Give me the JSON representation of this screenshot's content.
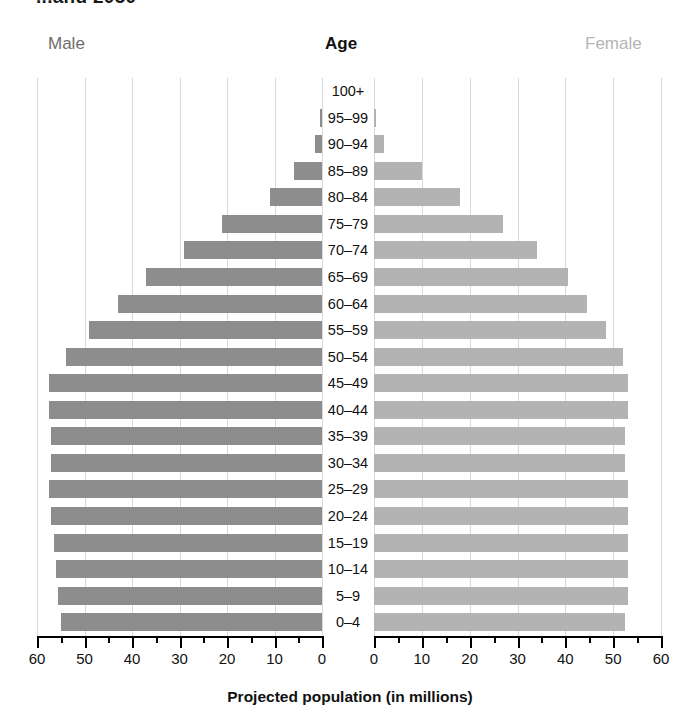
{
  "title_partial": "...and 2050",
  "headers": {
    "male": "Male",
    "age": "Age",
    "female": "Female"
  },
  "axis": {
    "xlabel": "Projected population (in millions)",
    "left_ticks": [
      "60",
      "50",
      "40",
      "30",
      "20",
      "10",
      "0"
    ],
    "right_ticks": [
      "0",
      "10",
      "20",
      "30",
      "40",
      "50",
      "60"
    ],
    "max": 60,
    "minor_step": 5
  },
  "colors": {
    "male_bar": "#8d8d8d",
    "female_bar": "#b3b3b3",
    "male_label": "#6d6d6d",
    "female_label": "#b5b5b5",
    "age_label": "#111111",
    "gridline": "#d8d8d8",
    "axis": "#000000",
    "background": "#ffffff"
  },
  "chart_data": {
    "type": "bar",
    "subtype": "population-pyramid",
    "xlabel": "Projected population (in millions)",
    "ylabel": "Age",
    "xlim": [
      0,
      60
    ],
    "grid": true,
    "legend": [
      "Male",
      "Female"
    ],
    "legend_position": "top",
    "orientation": "horizontal",
    "categories": [
      "100+",
      "95–99",
      "90–94",
      "85–89",
      "80–84",
      "75–79",
      "70–74",
      "65–69",
      "60–64",
      "55–59",
      "50–54",
      "45–49",
      "40–44",
      "35–39",
      "30–34",
      "25–29",
      "20–24",
      "15–19",
      "10–14",
      "5–9",
      "0–4"
    ],
    "series": [
      {
        "name": "Male",
        "side": "left",
        "color": "#8d8d8d",
        "values": [
          0.0,
          0.4,
          1.4,
          6.0,
          11.0,
          21.0,
          29.0,
          37.0,
          43.0,
          49.0,
          54.0,
          57.5,
          57.5,
          57.0,
          57.0,
          57.5,
          57.0,
          56.5,
          56.0,
          55.5,
          55.0
        ]
      },
      {
        "name": "Female",
        "side": "right",
        "color": "#b3b3b3",
        "values": [
          0.0,
          0.5,
          2.0,
          10.0,
          18.0,
          27.0,
          34.0,
          40.5,
          44.5,
          48.5,
          52.0,
          53.0,
          53.0,
          52.5,
          52.5,
          53.0,
          53.0,
          53.0,
          53.0,
          53.0,
          52.5
        ]
      }
    ]
  }
}
